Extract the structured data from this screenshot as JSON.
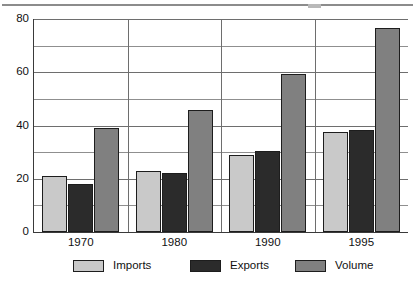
{
  "figure": {
    "name": "imports-exports-volume-bar-chart",
    "top_rule": true
  },
  "chart_data": {
    "type": "bar",
    "title": "",
    "subtitle": "",
    "xlabel": "",
    "ylabel": "",
    "categories": [
      "1970",
      "1980",
      "1990",
      "1995"
    ],
    "series": [
      {
        "name": "Imports",
        "color": "#c9c9c9",
        "values": [
          21,
          23,
          29,
          37.5
        ]
      },
      {
        "name": "Exports",
        "color": "#2b2b2b",
        "values": [
          18,
          22,
          30.5,
          38.5
        ]
      },
      {
        "name": "Volume",
        "color": "#808080",
        "values": [
          39,
          46,
          59.5,
          76.5
        ]
      }
    ],
    "ylim": [
      0,
      80
    ],
    "ytick_labels": [
      "0",
      "20",
      "40",
      "60",
      "80"
    ],
    "ytick_values": [
      0,
      20,
      40,
      60,
      80
    ],
    "gridline_values": [
      10,
      20,
      30,
      40,
      50,
      60,
      70,
      80
    ],
    "grid": true,
    "legend_position": "bottom",
    "legend_entries": [
      "Imports",
      "Exports",
      "Volume"
    ],
    "group_separators": true,
    "annotations": []
  }
}
